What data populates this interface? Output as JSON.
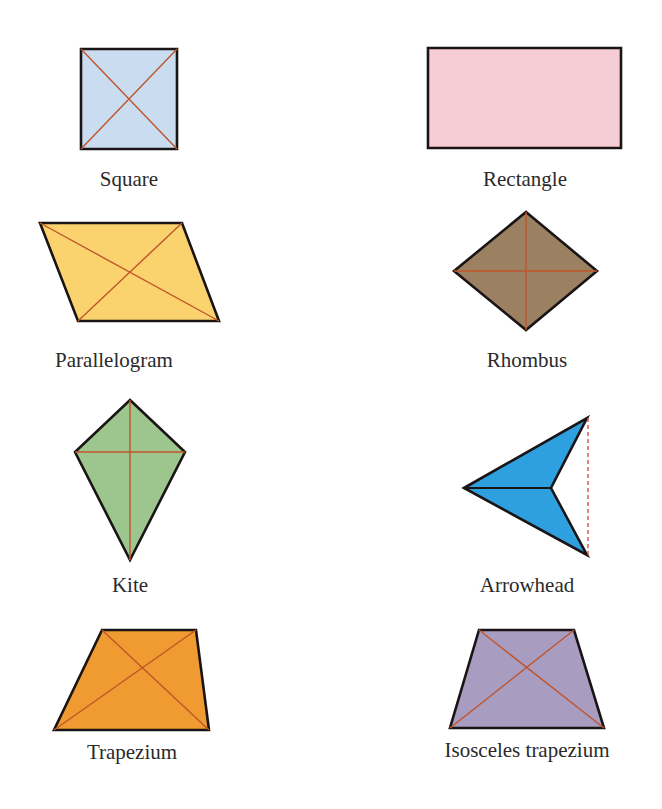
{
  "figure": {
    "background": "#ffffff",
    "outline_color": "#1a1414",
    "diagonal_color": "#c0552a",
    "dashed_color": "#d94040"
  },
  "shapes": [
    {
      "id": "square",
      "label": "Square",
      "fill": "#c9dcf0",
      "points": [
        [
          81,
          49
        ],
        [
          177,
          49
        ],
        [
          177,
          149
        ],
        [
          81,
          149
        ]
      ],
      "diagonals": [
        [
          [
            81,
            49
          ],
          [
            177,
            149
          ]
        ],
        [
          [
            177,
            49
          ],
          [
            81,
            149
          ]
        ]
      ],
      "label_pos": [
        129,
        169
      ]
    },
    {
      "id": "rectangle",
      "label": "Rectangle",
      "fill": "#f6cdd4",
      "points": [
        [
          428,
          48
        ],
        [
          621,
          48
        ],
        [
          621,
          148
        ],
        [
          428,
          148
        ]
      ],
      "diagonals": [],
      "label_pos": [
        525,
        169
      ]
    },
    {
      "id": "parallelogram",
      "label": "Parallelogram",
      "fill": "#fbd36e",
      "points": [
        [
          40,
          223
        ],
        [
          182,
          223
        ],
        [
          219,
          321
        ],
        [
          78,
          321
        ]
      ],
      "diagonals": [
        [
          [
            40,
            223
          ],
          [
            219,
            321
          ]
        ],
        [
          [
            182,
            223
          ],
          [
            78,
            321
          ]
        ]
      ],
      "label_pos": [
        114,
        350
      ]
    },
    {
      "id": "rhombus",
      "label": "Rhombus",
      "fill": "#9c8062",
      "points": [
        [
          526,
          212
        ],
        [
          597,
          271
        ],
        [
          526,
          330
        ],
        [
          454,
          271
        ]
      ],
      "diagonals": [
        [
          [
            526,
            212
          ],
          [
            526,
            330
          ]
        ],
        [
          [
            454,
            271
          ],
          [
            597,
            271
          ]
        ]
      ],
      "label_pos": [
        527,
        350
      ]
    },
    {
      "id": "kite",
      "label": "Kite",
      "fill": "#9cc68e",
      "points": [
        [
          130,
          400
        ],
        [
          185,
          452
        ],
        [
          130,
          560
        ],
        [
          75,
          452
        ]
      ],
      "diagonals": [
        [
          [
            130,
            400
          ],
          [
            130,
            560
          ]
        ],
        [
          [
            75,
            452
          ],
          [
            185,
            452
          ]
        ]
      ],
      "label_pos": [
        130,
        575
      ]
    },
    {
      "id": "arrowhead",
      "label": "Arrowhead",
      "fill": "#2ea0e0",
      "points": [
        [
          464,
          488
        ],
        [
          587,
          418
        ],
        [
          551,
          488
        ],
        [
          587,
          555
        ]
      ],
      "inner_line": [
        [
          464,
          488
        ],
        [
          551,
          488
        ]
      ],
      "dashed_line": [
        [
          588,
          418
        ],
        [
          588,
          555
        ]
      ],
      "diagonals": [],
      "label_pos": [
        527,
        575
      ]
    },
    {
      "id": "trapezium",
      "label": "Trapezium",
      "fill": "#f09a32",
      "points": [
        [
          102,
          630
        ],
        [
          196,
          630
        ],
        [
          209,
          730
        ],
        [
          54,
          730
        ]
      ],
      "diagonals": [
        [
          [
            102,
            630
          ],
          [
            209,
            730
          ]
        ],
        [
          [
            196,
            630
          ],
          [
            54,
            730
          ]
        ]
      ],
      "label_pos": [
        132,
        742
      ]
    },
    {
      "id": "isosceles-trapezium",
      "label": "Isosceles trapezium",
      "fill": "#a89cc0",
      "points": [
        [
          479,
          630
        ],
        [
          574,
          630
        ],
        [
          604,
          728
        ],
        [
          450,
          728
        ]
      ],
      "diagonals": [
        [
          [
            479,
            630
          ],
          [
            604,
            728
          ]
        ],
        [
          [
            574,
            630
          ],
          [
            450,
            728
          ]
        ]
      ],
      "label_pos": [
        527,
        740
      ]
    }
  ]
}
